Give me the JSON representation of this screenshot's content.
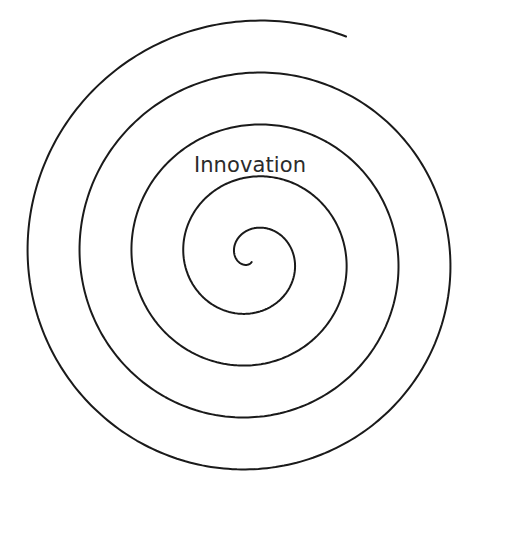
{
  "figure": {
    "type": "spiral-diagram",
    "background_color": "#ffffff",
    "width": 531,
    "height": 541
  },
  "spiral": {
    "name": "archimedean-spiral",
    "center_x": 252,
    "center_y": 258,
    "stroke_color": "#1a1a1a",
    "stroke_width": 2,
    "fill": "none",
    "turns": 4.55,
    "radial_spacing_px": 52,
    "inner_radius_px": 4,
    "start_angle_deg": 95,
    "direction": "clockwise",
    "inner_end_point": [
      248,
      268
    ],
    "outer_end_point": [
      257,
      519
    ],
    "measured_horizontal_crossings_left": [
      26,
      84,
      137,
      190
    ],
    "measured_horizontal_crossings_right": [
      295,
      348,
      400,
      452,
      505
    ],
    "measured_top_y": 30,
    "measured_bottom_y": 519
  },
  "label": {
    "text": "Innovation",
    "color": "#2b2b2b",
    "font_size_px": 21,
    "center_x": 250,
    "center_y": 165
  }
}
